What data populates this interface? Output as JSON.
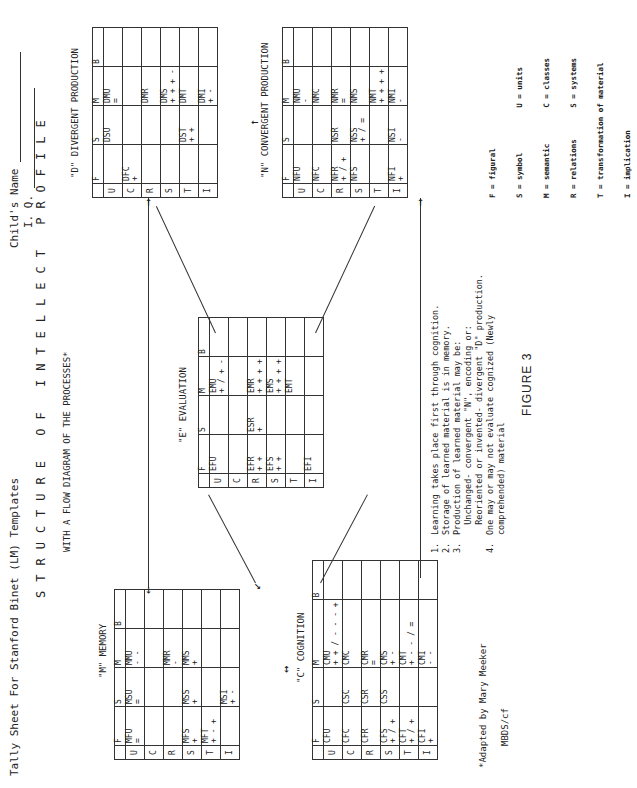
{
  "header": {
    "sheet_title": "Tally Sheet For Stanford Binet (LM) Templates",
    "childs_name_label": "Child's Name",
    "iq_label": "I. Q."
  },
  "title": {
    "main": "STRUCTURE OF INTELLECT PROFILE",
    "subtitle": "WITH A FLOW DIAGRAM OF THE PROCESSES*"
  },
  "column_headers": [
    "F",
    "S",
    "M",
    "B"
  ],
  "row_headers": [
    "U",
    "C",
    "R",
    "S",
    "T",
    "I"
  ],
  "memory": {
    "label": "\"M\" MEMORY",
    "cells": {
      "U": {
        "F": [
          "MFU",
          "="
        ],
        "S": [
          "MSU",
          "="
        ],
        "M": [
          "MMU",
          "- -"
        ],
        "B": [
          "",
          ""
        ]
      },
      "C": {
        "F": [
          "",
          ""
        ],
        "S": [
          "",
          ""
        ],
        "M": [
          "",
          ""
        ],
        "B": [
          "",
          ""
        ]
      },
      "R": {
        "F": [
          "",
          ""
        ],
        "S": [
          "",
          ""
        ],
        "M": [
          "MMR",
          "-"
        ],
        "B": [
          "",
          ""
        ]
      },
      "S": {
        "F": [
          "MFS",
          "+"
        ],
        "S": [
          "MSS",
          "+"
        ],
        "M": [
          "MMS",
          "+"
        ],
        "B": [
          "",
          ""
        ]
      },
      "T": {
        "F": [
          "MFT",
          "+ - +"
        ],
        "S": [
          "",
          ""
        ],
        "M": [
          "",
          ""
        ],
        "B": [
          "",
          ""
        ]
      },
      "I": {
        "F": [
          "",
          ""
        ],
        "S": [
          "MSI",
          "+ -"
        ],
        "M": [
          "",
          ""
        ],
        "B": [
          "",
          ""
        ]
      }
    }
  },
  "cognition": {
    "label": "\"C\" COGNITION",
    "cells": {
      "U": {
        "F": [
          "CFU",
          ""
        ],
        "S": [
          "",
          ""
        ],
        "M": [
          "CMU",
          "+ + / - - - +"
        ],
        "B": [
          "",
          ""
        ]
      },
      "C": {
        "F": [
          "CFC",
          ""
        ],
        "S": [
          "CSC",
          ""
        ],
        "M": [
          "CMC",
          ""
        ],
        "B": [
          "",
          ""
        ]
      },
      "R": {
        "F": [
          "CFR",
          ""
        ],
        "S": [
          "CSR",
          ""
        ],
        "M": [
          "CMR",
          "="
        ],
        "B": [
          "",
          ""
        ]
      },
      "S": {
        "F": [
          "CFS",
          "+ / +"
        ],
        "S": [
          "CSS",
          ""
        ],
        "M": [
          "CMS",
          "+ -"
        ],
        "B": [
          "",
          ""
        ]
      },
      "T": {
        "F": [
          "CFT",
          "+ / +"
        ],
        "S": [
          "",
          ""
        ],
        "M": [
          "CMT",
          "+ - - / ="
        ],
        "B": [
          "",
          ""
        ]
      },
      "I": {
        "F": [
          "CFI",
          "+"
        ],
        "S": [
          "",
          ""
        ],
        "M": [
          "CMI",
          "- -"
        ],
        "B": [
          "",
          ""
        ]
      }
    }
  },
  "evaluation": {
    "label": "\"E\" EVALUATION",
    "cells": {
      "U": {
        "F": [
          "EFU",
          ""
        ],
        "S": [
          "",
          ""
        ],
        "M": [
          "EMU",
          "+ / + -"
        ],
        "B": [
          "",
          ""
        ]
      },
      "C": {
        "F": [
          "",
          ""
        ],
        "S": [
          "",
          ""
        ],
        "M": [
          "",
          ""
        ],
        "B": [
          "",
          ""
        ]
      },
      "R": {
        "F": [
          "EFR",
          "+ +"
        ],
        "S": [
          "ESR",
          "+"
        ],
        "M": [
          "EMR",
          "+ + + +"
        ],
        "B": [
          "",
          ""
        ]
      },
      "S": {
        "F": [
          "EFS",
          "+ +"
        ],
        "S": [
          "",
          ""
        ],
        "M": [
          "EMS",
          "+ + + +"
        ],
        "B": [
          "",
          ""
        ]
      },
      "T": {
        "F": [
          "",
          ""
        ],
        "S": [
          "",
          ""
        ],
        "M": [
          "EMT",
          ""
        ],
        "B": [
          "",
          ""
        ]
      },
      "I": {
        "F": [
          "EFI",
          ""
        ],
        "S": [
          "",
          ""
        ],
        "M": [
          "",
          ""
        ],
        "B": [
          "",
          ""
        ]
      }
    }
  },
  "divergent": {
    "label": "\"D\" DIVERGENT PRODUCTION",
    "cells": {
      "U": {
        "F": [
          "",
          ""
        ],
        "S": [
          "DSU",
          ""
        ],
        "M": [
          "DMU",
          "="
        ],
        "B": [
          "",
          ""
        ]
      },
      "C": {
        "F": [
          "DFC",
          "+"
        ],
        "S": [
          "",
          ""
        ],
        "M": [
          "",
          ""
        ],
        "B": [
          "",
          ""
        ]
      },
      "R": {
        "F": [
          "",
          ""
        ],
        "S": [
          "",
          ""
        ],
        "M": [
          "DMR",
          ""
        ],
        "B": [
          "",
          ""
        ]
      },
      "S": {
        "F": [
          "",
          ""
        ],
        "S": [
          "",
          ""
        ],
        "M": [
          "DMS",
          "+ + + -"
        ],
        "B": [
          "",
          ""
        ]
      },
      "T": {
        "F": [
          "",
          ""
        ],
        "S": [
          "DST",
          "+ +"
        ],
        "M": [
          "DMT",
          ""
        ],
        "B": [
          "",
          ""
        ]
      },
      "I": {
        "F": [
          "",
          ""
        ],
        "S": [
          "",
          ""
        ],
        "M": [
          "DMI",
          "+ -"
        ],
        "B": [
          "",
          ""
        ]
      }
    }
  },
  "convergent": {
    "label": "\"N\" CONVERGENT PRODUCTION",
    "cells": {
      "U": {
        "F": [
          "NFU",
          ""
        ],
        "S": [
          "",
          ""
        ],
        "M": [
          "NMU",
          "-"
        ],
        "B": [
          "",
          ""
        ]
      },
      "C": {
        "F": [
          "NFC",
          ""
        ],
        "S": [
          "",
          ""
        ],
        "M": [
          "NMC",
          ""
        ],
        "B": [
          "",
          ""
        ]
      },
      "R": {
        "F": [
          "NFR",
          "+ / +"
        ],
        "S": [
          "NSR",
          ""
        ],
        "M": [
          "NMR",
          "="
        ],
        "B": [
          "",
          ""
        ]
      },
      "S": {
        "F": [
          "NFS",
          ""
        ],
        "S": [
          "NSS",
          "+ / ="
        ],
        "M": [
          "NMS",
          ""
        ],
        "B": [
          "",
          ""
        ]
      },
      "T": {
        "F": [
          "",
          ""
        ],
        "S": [
          "",
          ""
        ],
        "M": [
          "NMT",
          "+ + + +"
        ],
        "B": [
          "",
          ""
        ]
      },
      "I": {
        "F": [
          "NFI",
          "+"
        ],
        "S": [
          "NSI",
          "-"
        ],
        "M": [
          "NMI",
          "-"
        ],
        "B": [
          "",
          ""
        ]
      }
    }
  },
  "notes": [
    {
      "num": "1.",
      "text": "Learning takes place first through cognition."
    },
    {
      "num": "2.",
      "text": "Storage of learned material is in memory."
    },
    {
      "num": "3.",
      "text": "Production of learned material may be:"
    },
    {
      "num": "",
      "text": "  Unchanged- convergent \"N\", encoding or:"
    },
    {
      "num": "",
      "text": "  Reoriented or invented- divergent \"D\" production."
    },
    {
      "num": "4.",
      "text": "One may or may not evaluate cognized (Newly"
    },
    {
      "num": "",
      "text": "comprehended) material"
    }
  ],
  "legend": [
    "F = figural",
    "S = symbol          U = units",
    "M = semantic        C = classes",
    "R = relations       S = systems",
    "T = transformation of material",
    "I = implication"
  ],
  "footer": {
    "adapted": "*Adapted by Mary Meeker",
    "ref": "MBDS/cf",
    "figure": "FIGURE 3"
  }
}
